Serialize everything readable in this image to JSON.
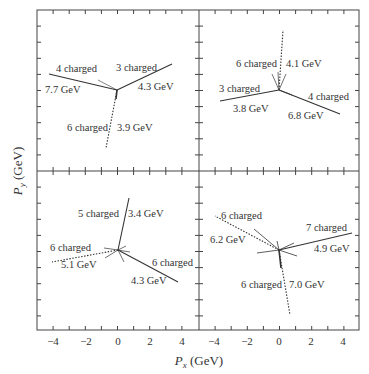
{
  "chart_data": {
    "type": "scatter",
    "xlabel": "P_x (GeV)",
    "ylabel": "P_y (GeV)",
    "xlim": [
      -5,
      5
    ],
    "ylim": [
      -5,
      5
    ],
    "x_tick_labels": [
      "-4",
      "-2",
      "0",
      "2",
      "4"
    ],
    "grid": false,
    "panels": [
      {
        "position": "top-left",
        "jets": [
          {
            "label": "4 charged",
            "energy": "7.7 GeV",
            "end": [
              -4.2,
              1.0
            ],
            "style": "solid"
          },
          {
            "label": "3 charged",
            "energy": "4.3 GeV",
            "end": [
              3.4,
              1.6
            ],
            "style": "solid"
          },
          {
            "label": "6 charged",
            "energy": "3.9 GeV",
            "end": [
              -0.7,
              -3.6
            ],
            "style": "dotted"
          }
        ]
      },
      {
        "position": "top-right",
        "jets": [
          {
            "label": "6 charged",
            "energy": "4.1 GeV",
            "end": [
              0.25,
              3.7
            ],
            "style": "dotted"
          },
          {
            "label": "3 charged",
            "energy": "3.8 GeV",
            "end": [
              -3.6,
              -0.7
            ],
            "style": "solid"
          },
          {
            "label": "4 charged",
            "energy": "6.8 GeV",
            "end": [
              3.8,
              -1.5
            ],
            "style": "solid"
          }
        ]
      },
      {
        "position": "bottom-left",
        "jets": [
          {
            "label": "5 charged",
            "energy": "3.4 GeV",
            "end": [
              0.7,
              3.2
            ],
            "style": "solid"
          },
          {
            "label": "6 charged",
            "energy": "5.1 GeV",
            "end": [
              -4.1,
              -0.75
            ],
            "style": "dotted"
          },
          {
            "label": "6 charged",
            "energy": "4.3 GeV",
            "end": [
              3.7,
              -2.0
            ],
            "style": "solid"
          }
        ]
      },
      {
        "position": "bottom-right",
        "jets": [
          {
            "label": "6 charged",
            "energy": "6.2 GeV",
            "end": [
              -3.9,
              2.1
            ],
            "style": "dotted"
          },
          {
            "label": "7 charged",
            "energy": "4.9 GeV",
            "end": [
              4.5,
              1.05
            ],
            "style": "solid"
          },
          {
            "label": "6 charged",
            "energy": "7.0 GeV",
            "end": [
              0.7,
              -4.0
            ],
            "style": "dotted"
          }
        ]
      }
    ]
  },
  "labels": {
    "p1": {
      "a": "4 charged",
      "a_e": "7.7 GeV",
      "b": "3 charged",
      "b_e": "4.3 GeV",
      "c": "6 charged",
      "c_e": "3.9 GeV"
    },
    "p2": {
      "a": "6 charged",
      "a_e": "4.1 GeV",
      "b": "3 charged",
      "b_e": "3.8 GeV",
      "c": "4 charged",
      "c_e": "6.8 GeV"
    },
    "p3": {
      "a": "5 charged",
      "a_e": "3.4 GeV",
      "b": "6 charged",
      "b_e": "5.1 GeV",
      "c": "6 charged",
      "c_e": "4.3 GeV"
    },
    "p4": {
      "a": "6 charged",
      "a_e": "6.2 GeV",
      "b": "7 charged",
      "b_e": "4.9 GeV",
      "c": "6 charged",
      "c_e": "7.0 GeV"
    }
  },
  "axes": {
    "x_title_main": "P",
    "x_title_sub": "x",
    "x_title_unit": " (GeV)",
    "y_title_main": "P",
    "y_title_sub": "y",
    "y_title_unit": " (GeV)",
    "x_ticks": [
      "−4",
      "−2",
      "0",
      "2",
      "4"
    ]
  }
}
